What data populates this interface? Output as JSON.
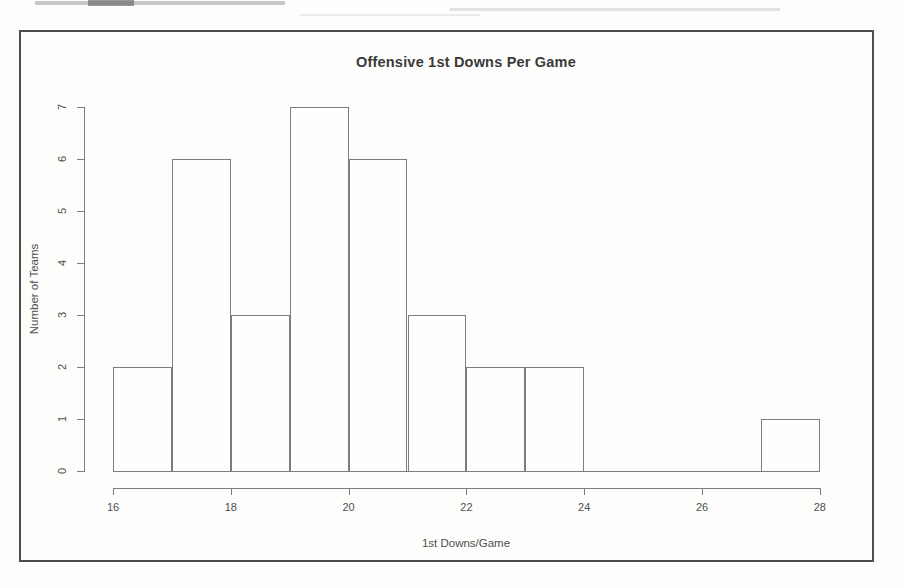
{
  "page": {
    "kind": "scanned histogram figure",
    "paper_color": "#fdfdfc",
    "frame_border_color": "#4e4e4e"
  },
  "chart_data": {
    "type": "bar",
    "subtype": "histogram",
    "title": "Offensive 1st Downs Per Game",
    "xlabel": "1st Downs/Game",
    "ylabel": "Number of Teams",
    "bin_breaks": [
      16,
      17,
      18,
      19,
      20,
      21,
      22,
      23,
      24,
      25,
      26,
      27,
      28
    ],
    "counts": [
      2,
      6,
      3,
      7,
      6,
      3,
      2,
      2,
      0,
      0,
      0,
      1
    ],
    "x_ticks": [
      16,
      18,
      20,
      22,
      24,
      26,
      28
    ],
    "y_ticks": [
      0,
      1,
      2,
      3,
      4,
      5,
      6,
      7
    ],
    "xlim": [
      16,
      28
    ],
    "ylim": [
      0,
      7
    ],
    "grid": false,
    "legend": null,
    "bar_fill": "#fefefe",
    "bar_border": "#7d7d7d",
    "axis_color": "#7d7d7d",
    "text_color": "#4f4f4f",
    "title_color": "#3a3a3a"
  }
}
